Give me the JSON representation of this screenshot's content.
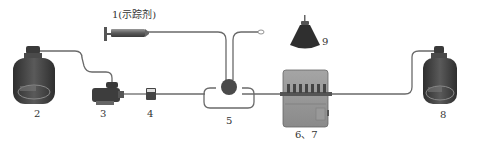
{
  "diagram": {
    "labels": {
      "tracer": "1(示踪剂)",
      "reservoir_left": "2",
      "pump": "3",
      "filter": "4",
      "valve": "5",
      "detector": "6、7",
      "reservoir_right": "8",
      "funnel": "9"
    },
    "colors": {
      "tube": "#6a6a6a",
      "body_dark": "#3a3a3a",
      "body_mid": "#8a8a8a",
      "valve": "#4a4a4a"
    }
  }
}
